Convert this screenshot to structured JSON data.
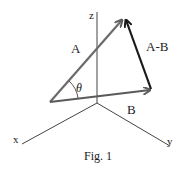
{
  "figure": {
    "caption": "Fig. 1",
    "axes": {
      "x_label": "x",
      "y_label": "y",
      "z_label": "z"
    },
    "vectors": {
      "a": {
        "label": "A",
        "color": "#6b6b6b"
      },
      "b": {
        "label": "B",
        "color": "#5a5a5a"
      },
      "diff": {
        "label": "A-B",
        "color": "#1a1a1a"
      }
    },
    "angle_label": "θ"
  }
}
